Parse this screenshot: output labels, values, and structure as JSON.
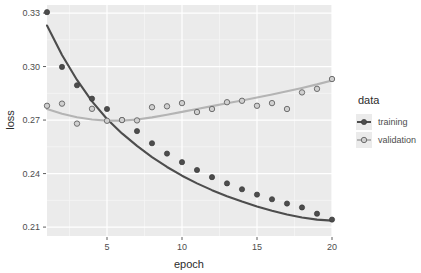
{
  "chart_data": {
    "type": "scatter",
    "title": "",
    "xlabel": "epoch",
    "ylabel": "loss",
    "xlim": [
      1,
      20
    ],
    "ylim": [
      0.205,
      0.3345
    ],
    "xticks": [
      5,
      10,
      15,
      20
    ],
    "xticklabels": [
      "5",
      "10",
      "15",
      "20"
    ],
    "yticks": [
      0.21,
      0.24,
      0.27,
      0.3,
      0.33
    ],
    "yticklabels": [
      "0.21",
      "0.24",
      "0.27",
      "0.30",
      "0.33"
    ],
    "grid": true,
    "grid_minor": true,
    "legend": {
      "title": "data",
      "position": "right",
      "entries": [
        {
          "name": "training",
          "color": "#4d4d4d",
          "marker": "filled-circle"
        },
        {
          "name": "validation",
          "color": "#b4b4b4",
          "marker": "open-circle"
        }
      ]
    },
    "x": [
      1,
      2,
      3,
      4,
      5,
      6,
      7,
      8,
      9,
      10,
      11,
      12,
      13,
      14,
      15,
      16,
      17,
      18,
      19,
      20
    ],
    "series": [
      {
        "name": "training",
        "color": "#4d4d4d",
        "point_color": "#4d4d4d",
        "line": "smooth",
        "values": [
          0.3305,
          0.2998,
          0.2895,
          0.282,
          0.2762,
          0.27,
          0.2638,
          0.257,
          0.2512,
          0.2464,
          0.242,
          0.238,
          0.2345,
          0.2312,
          0.2282,
          0.2256,
          0.2232,
          0.221,
          0.2175,
          0.2142
        ],
        "smooth": [
          0.323,
          0.3065,
          0.2925,
          0.2805,
          0.2706,
          0.2625,
          0.2555,
          0.2492,
          0.2437,
          0.2388,
          0.2345,
          0.2307,
          0.2273,
          0.2243,
          0.2216,
          0.2192,
          0.2171,
          0.2154,
          0.2142,
          0.2136
        ]
      },
      {
        "name": "validation",
        "color": "#b4b4b4",
        "point_color": "#7a7a7a",
        "line": "smooth",
        "values": [
          0.278,
          0.2792,
          0.268,
          0.2763,
          0.2696,
          0.27,
          0.2698,
          0.2772,
          0.2777,
          0.2795,
          0.2745,
          0.2762,
          0.28,
          0.2808,
          0.278,
          0.2795,
          0.2762,
          0.2855,
          0.2875,
          0.293
        ],
        "smooth": [
          0.2762,
          0.2735,
          0.2716,
          0.2703,
          0.2697,
          0.2697,
          0.2703,
          0.2715,
          0.273,
          0.2746,
          0.2762,
          0.2778,
          0.2794,
          0.281,
          0.2826,
          0.2843,
          0.2861,
          0.288,
          0.29,
          0.2922
        ]
      }
    ]
  },
  "style": {
    "panel_bg": "#ebebeb",
    "grid_major": "#ffffff",
    "grid_minor": "#f5f5f5",
    "page_bg": "#ffffff",
    "text_color": "#4d4d4d"
  },
  "panel": {
    "x": 47,
    "y": 5,
    "width": 285,
    "height": 231
  }
}
